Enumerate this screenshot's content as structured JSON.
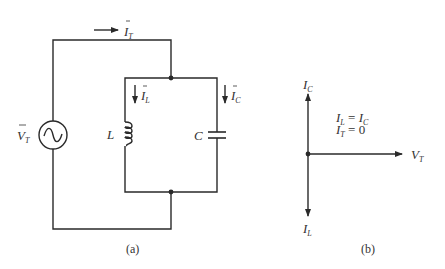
{
  "figure": {
    "panel_a": {
      "caption": "(a)",
      "labels": {
        "source_voltage": {
          "main": "V",
          "sub": "T",
          "overbar": true
        },
        "total_current": {
          "main": "I",
          "sub": "T",
          "overbar": true
        },
        "inductor_current": {
          "main": "I",
          "sub": "L",
          "overbar": true
        },
        "capacitor_current": {
          "main": "I",
          "sub": "C",
          "overbar": true
        },
        "inductor": "L",
        "capacitor": "C"
      },
      "components": [
        "ac-voltage-source",
        "inductor",
        "capacitor"
      ]
    },
    "panel_b": {
      "caption": "(b)",
      "phasors": [
        {
          "name": "I_C",
          "main": "I",
          "sub": "C",
          "direction": "up"
        },
        {
          "name": "I_L",
          "main": "I",
          "sub": "L",
          "direction": "down"
        },
        {
          "name": "V_T",
          "main": "V",
          "sub": "T",
          "direction": "right"
        }
      ],
      "equations": [
        {
          "lhs_main": "I",
          "lhs_sub": "L",
          "op": " = ",
          "rhs_main": "I",
          "rhs_sub": "C"
        },
        {
          "lhs_main": "I",
          "lhs_sub": "T",
          "op": " = ",
          "rhs": "0"
        }
      ]
    },
    "colors": {
      "line": "#2a2a2a",
      "text": "#333333",
      "background": "#ffffff"
    }
  }
}
